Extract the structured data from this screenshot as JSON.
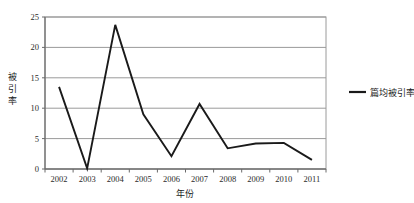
{
  "chart_data": {
    "type": "line",
    "title": "",
    "xlabel": "年份",
    "ylabel": "被引率",
    "categories": [
      "2002",
      "2003",
      "2004",
      "2005",
      "2006",
      "2007",
      "2008",
      "2009",
      "2010",
      "2011"
    ],
    "series": [
      {
        "name": "篇均被引率",
        "values": [
          13.5,
          0.1,
          23.7,
          9.0,
          2.1,
          10.7,
          3.4,
          4.2,
          4.3,
          1.5
        ]
      }
    ],
    "ylim": [
      0,
      25
    ],
    "yticks": [
      "0",
      "5",
      "10",
      "15",
      "20",
      "25"
    ],
    "ytick_values": [
      0,
      5,
      10,
      15,
      20,
      25
    ],
    "grid": true,
    "grid_axis": "y",
    "legend_position": "right",
    "line_color": "#1a1a1a"
  },
  "legend": {
    "entries": [
      {
        "label": "篇均被引率",
        "swatch_color": "#1a1a1a"
      }
    ]
  },
  "axes": {
    "y_label_chars": [
      "被",
      "引",
      "率"
    ],
    "x_title": "年份"
  }
}
